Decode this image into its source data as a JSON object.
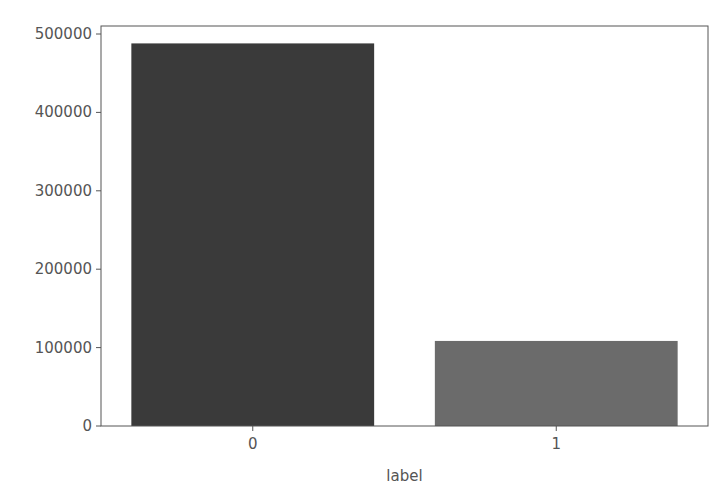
{
  "chart_data": {
    "type": "bar",
    "title": "",
    "xlabel": "label",
    "ylabel": "",
    "categories": [
      "0",
      "1"
    ],
    "values": [
      488000,
      108500
    ],
    "ylim": [
      0,
      512000
    ],
    "yticks": [
      0,
      100000,
      200000,
      300000,
      400000,
      500000
    ],
    "ytick_labels": [
      "0",
      "100000",
      "200000",
      "300000",
      "400000",
      "500000"
    ],
    "colors": [
      "#3a3a3a",
      "#6b6b6b"
    ],
    "grid": false,
    "legend": null
  }
}
